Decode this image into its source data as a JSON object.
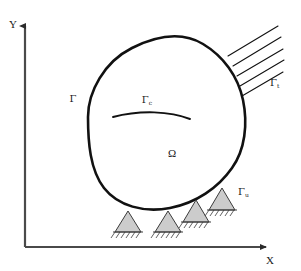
{
  "figure": {
    "type": "diagram",
    "background_color": "#ffffff",
    "line_color": "#111111",
    "support_fill": "#cccccc",
    "axis_color": "#4a4a4a"
  },
  "axes": {
    "y_label": "Y",
    "x_label": "X",
    "origin": {
      "x": 25,
      "y": 247
    },
    "y_tip": {
      "x": 25,
      "y": 22
    },
    "x_tip": {
      "x": 272,
      "y": 247
    }
  },
  "labels": {
    "domain": {
      "symbol": "Ω",
      "name": "omega-domain-label",
      "x": 172,
      "y": 155
    },
    "boundary": {
      "symbol": "Γ",
      "subscript": "",
      "name": "gamma-boundary-label",
      "x": 73,
      "y": 100
    },
    "crack": {
      "symbol": "Γ",
      "subscript": "c",
      "name": "gamma-c-crack-label",
      "x": 148,
      "y": 103
    },
    "traction": {
      "symbol": "Γ",
      "subscript": "t",
      "name": "gamma-t-traction-label",
      "x": 272,
      "y": 85
    },
    "displacement": {
      "symbol": "Γ",
      "subscript": "u",
      "name": "gamma-u-displacement-label",
      "x": 237,
      "y": 193
    }
  },
  "body_outline": {
    "description": "closed irregular convex blob representing elastic body Omega",
    "path": "M 88 117 C 88 92, 104 62, 132 48 C 158 35, 183 32, 203 44 C 223 56, 238 76, 243 100 C 248 124, 245 150, 232 168 C 218 188, 196 203, 170 208 C 144 213, 118 206, 104 188 C 90 170, 88 142, 88 117 Z",
    "stroke_width": 2.6
  },
  "crack_arc": {
    "description": "internal curved crack line Gamma_c",
    "path": "M 113 117 C 140 110, 170 111, 190 119",
    "stroke_width": 1.8
  },
  "traction_lines": {
    "count": 5,
    "description": "parallel inclined hatch lines indicating applied traction on Gamma_t",
    "lines": [
      {
        "x1": 228,
        "y1": 56,
        "x2": 278,
        "y2": 26
      },
      {
        "x1": 233,
        "y1": 66,
        "x2": 281,
        "y2": 37
      },
      {
        "x1": 237,
        "y1": 76,
        "x2": 283,
        "y2": 49
      },
      {
        "x1": 240,
        "y1": 86,
        "x2": 284,
        "y2": 60
      },
      {
        "x1": 242,
        "y1": 96,
        "x2": 283,
        "y2": 72
      }
    ],
    "stroke_width": 1.1
  },
  "supports": {
    "count": 4,
    "description": "triangular pin supports with ground hatching along Gamma_u",
    "items": [
      {
        "name": "support-1",
        "cx": 128,
        "apex_y": 211,
        "base_y": 232,
        "half_width": 13
      },
      {
        "name": "support-2",
        "cx": 168,
        "apex_y": 211,
        "base_y": 232,
        "half_width": 13
      },
      {
        "name": "support-3",
        "cx": 196,
        "apex_y": 200,
        "base_y": 222,
        "half_width": 13
      },
      {
        "name": "support-4",
        "cx": 222,
        "apex_y": 188,
        "base_y": 210,
        "half_width": 13
      }
    ],
    "hatch_tick_count": 6
  }
}
